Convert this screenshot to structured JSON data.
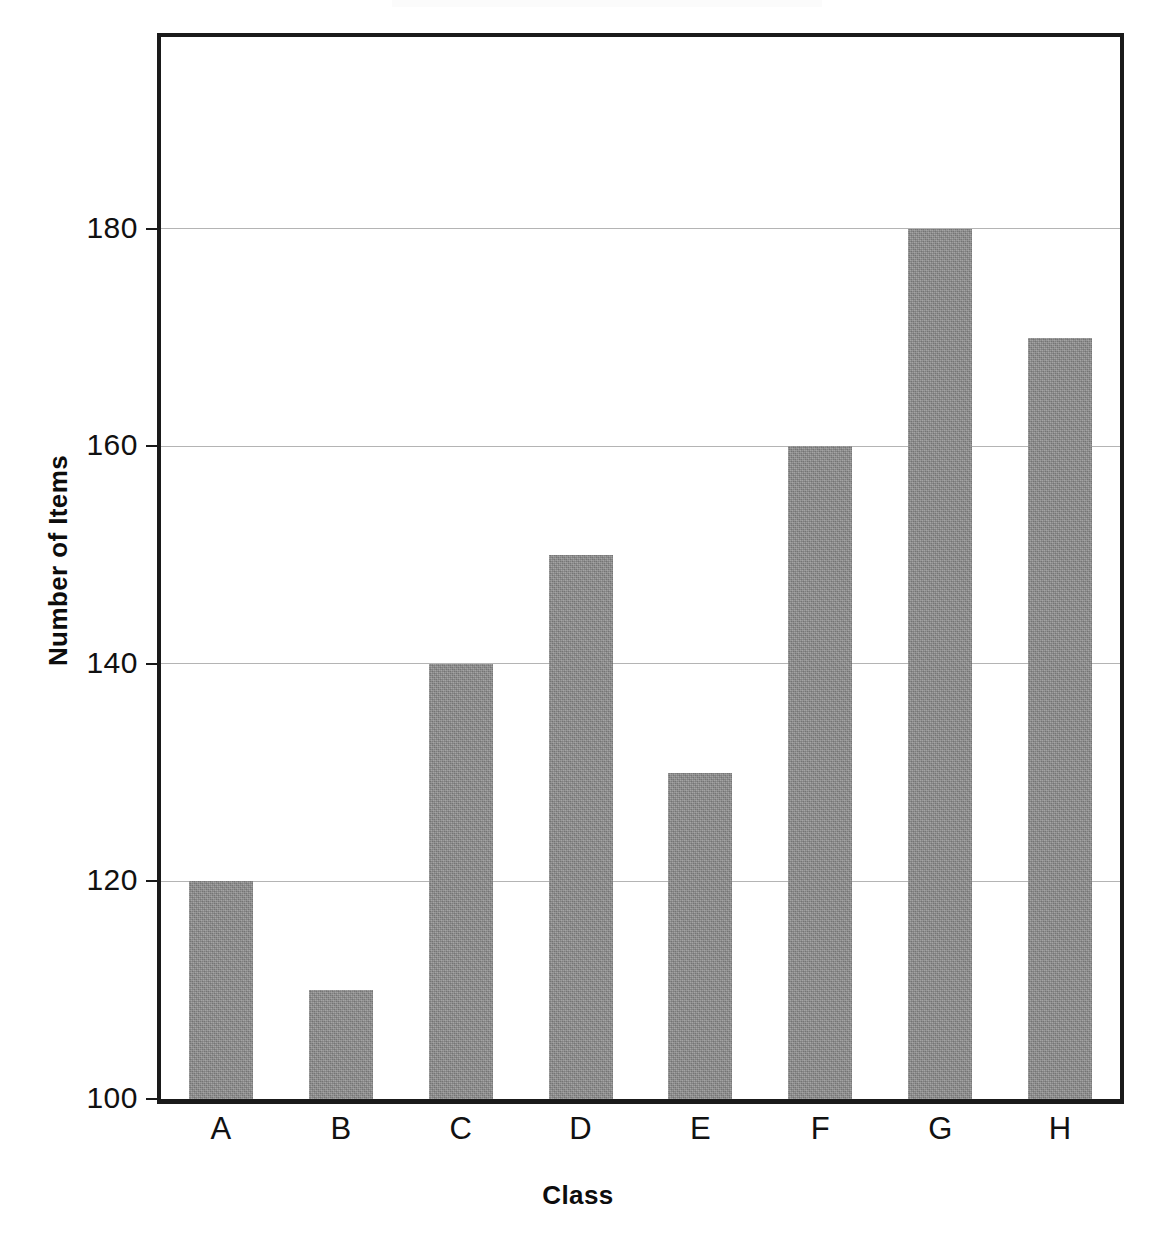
{
  "chart_data": {
    "type": "bar",
    "title": "",
    "subtitle": "",
    "xlabel": "Class",
    "ylabel": "Number of Items",
    "categories": [
      "A",
      "B",
      "C",
      "D",
      "E",
      "F",
      "G",
      "H"
    ],
    "values": [
      120,
      110,
      140,
      150,
      130,
      160,
      180,
      170
    ],
    "series": [
      {
        "name": "Number of Items",
        "values": [
          120,
          110,
          140,
          150,
          130,
          160,
          180,
          170
        ]
      }
    ],
    "ylim": [
      100,
      198
    ],
    "xlim": [
      0,
      8
    ],
    "yticks": [
      100,
      120,
      140,
      160,
      180
    ],
    "ytick_labels": [
      "100",
      "120",
      "140",
      "160",
      "180"
    ],
    "xtick_labels": [
      "A",
      "B",
      "C",
      "D",
      "E",
      "F",
      "G",
      "H"
    ],
    "grid": {
      "horizontal": true,
      "vertical": false,
      "color": "#b4b4b4"
    },
    "legend": {
      "visible": false,
      "position": "none",
      "entries": []
    },
    "annotations": [],
    "bar_color": "#8b8b8b",
    "bar_edge_color": "#8b8b8b",
    "background_color": "#ffffff",
    "axis_color": "#1a1a1a",
    "text_color": "#111111"
  },
  "axes": {
    "y_title": "Number of Items",
    "x_title": "Class",
    "y_ticks": [
      {
        "label": "180",
        "value": 180
      },
      {
        "label": "160",
        "value": 160
      },
      {
        "label": "140",
        "value": 140
      },
      {
        "label": "120",
        "value": 120
      },
      {
        "label": "100",
        "value": 100
      }
    ]
  }
}
